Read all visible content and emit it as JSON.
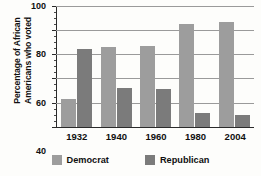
{
  "chart_data": {
    "type": "bar",
    "title": "",
    "subtitle": "",
    "xlabel": "",
    "ylabel": "Percentage of African\nAmericans who voted",
    "categories": [
      "1932",
      "1940",
      "1960",
      "1980",
      "2004"
    ],
    "series": [
      {
        "name": "Democrat",
        "values": [
          23,
          66,
          67,
          85,
          87
        ],
        "color": "#9d9d9d"
      },
      {
        "name": "Republican",
        "values": [
          64,
          32,
          31,
          11,
          10
        ],
        "color": "#7b7b7b"
      }
    ],
    "ylim": [
      0,
      100
    ],
    "ytick_labels": [
      "0",
      "20",
      "40",
      "60",
      "80",
      "100"
    ],
    "ytick_values": [
      0,
      20,
      40,
      60,
      80,
      100
    ],
    "yminor_step": 5,
    "grid": "horizontal",
    "legend_position": "bottom-center"
  },
  "legend": {
    "items": [
      {
        "label": "Democrat"
      },
      {
        "label": "Republican"
      }
    ]
  },
  "axis": {
    "y_title": "Percentage of African\nAmericans who voted"
  }
}
